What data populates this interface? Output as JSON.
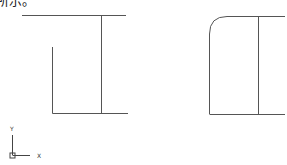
{
  "caption": "所示。",
  "axis_icon": {
    "x_label": "X",
    "y_label": "Y"
  },
  "figures": [
    {
      "name": "left-profile",
      "corner": "sharp"
    },
    {
      "name": "right-profile",
      "corner": "filleted"
    }
  ],
  "colors": {
    "stroke": "#555555",
    "background": "#ffffff"
  }
}
